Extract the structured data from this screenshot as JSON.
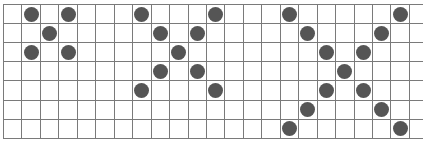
{
  "grid": {
    "rows": 7,
    "cols": 23,
    "cell_width": 18.45,
    "cell_height": 19.1,
    "line_color": "#7a7a7a",
    "dot_color": "#555555",
    "dot_diameter": 15
  },
  "patterns": [
    {
      "name": "x-pattern-small",
      "size": 3,
      "dots": [
        [
          0,
          1
        ],
        [
          0,
          3
        ],
        [
          1,
          2
        ],
        [
          2,
          1
        ],
        [
          2,
          3
        ]
      ]
    },
    {
      "name": "x-pattern-medium",
      "size": 5,
      "dots": [
        [
          0,
          7
        ],
        [
          0,
          11
        ],
        [
          1,
          8
        ],
        [
          1,
          10
        ],
        [
          2,
          9
        ],
        [
          3,
          8
        ],
        [
          3,
          10
        ],
        [
          4,
          7
        ],
        [
          4,
          11
        ]
      ]
    },
    {
      "name": "x-pattern-large",
      "size": 7,
      "dots": [
        [
          0,
          15
        ],
        [
          0,
          21
        ],
        [
          1,
          16
        ],
        [
          1,
          20
        ],
        [
          2,
          17
        ],
        [
          2,
          19
        ],
        [
          3,
          18
        ],
        [
          4,
          17
        ],
        [
          4,
          19
        ],
        [
          5,
          16
        ],
        [
          5,
          20
        ],
        [
          6,
          15
        ],
        [
          6,
          21
        ]
      ]
    }
  ]
}
